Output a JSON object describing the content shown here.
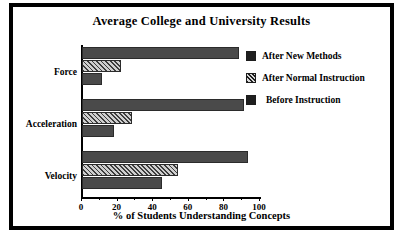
{
  "chart_data": {
    "type": "bar",
    "orientation": "horizontal",
    "title": "Average College and University Results",
    "xlabel": "% of Students Understanding Concepts",
    "ylabel": "",
    "xlim": [
      0,
      100
    ],
    "xticks": [
      0,
      20,
      40,
      60,
      80,
      100
    ],
    "xtick_labels": [
      "0",
      "20",
      "40",
      "60",
      "80",
      "100"
    ],
    "minor_ticks": [
      10,
      30,
      50,
      70,
      90
    ],
    "grid": false,
    "legend_position": "right",
    "categories": [
      "Force",
      "Acceleration",
      "Velocity"
    ],
    "series": [
      {
        "name": "After New Methods",
        "fill": "solid",
        "color": "#4a4a4a",
        "values": [
          88,
          91,
          93
        ]
      },
      {
        "name": "After Normal Instruction",
        "fill": "hatch",
        "color": "#3d3d3d",
        "values": [
          22,
          28,
          54
        ]
      },
      {
        "name": "Before Instruction",
        "fill": "solid",
        "color": "#4a4a4a",
        "values": [
          11,
          18,
          45
        ]
      }
    ]
  },
  "figure": {
    "title": "Average College and University Results",
    "axis_title_x": "% of Students Understanding Concepts",
    "categories": {
      "c0": "Force",
      "c1": "Acceleration",
      "c2": "Velocity"
    },
    "ticks": {
      "t0": "0",
      "t1": "20",
      "t2": "40",
      "t3": "60",
      "t4": "80",
      "t5": "100"
    },
    "legend": {
      "i0": "After New Methods",
      "i1": "After Normal Instruction",
      "i2": "Before Instruction"
    },
    "colors": {
      "bar_solid": "#4a4a4a",
      "bar_hatch": "#3d3d3d",
      "frame": "#000000",
      "background": "#ffffff"
    }
  }
}
